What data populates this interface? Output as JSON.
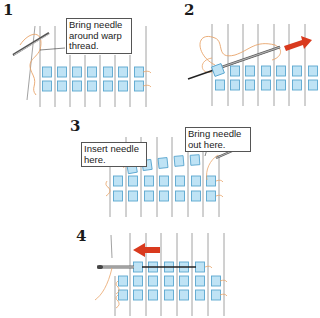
{
  "colors": {
    "bead_fill": "#bfe3f5",
    "bead_stroke": "#5aa6cf",
    "warp": "#8a8a8a",
    "thread": "#e8a46a",
    "arrow": "#d93a1e",
    "needle": "#555555"
  },
  "steps": [
    {
      "number": "1",
      "label": "Bring needle\naround warp\nthread."
    },
    {
      "number": "2"
    },
    {
      "number": "3",
      "labels": [
        "Insert needle\nhere.",
        "Bring  needle\nout here."
      ]
    },
    {
      "number": "4"
    }
  ]
}
